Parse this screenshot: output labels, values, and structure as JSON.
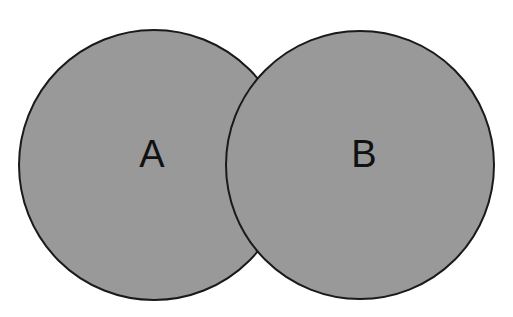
{
  "figure": {
    "type": "venn-diagram",
    "title": "",
    "background_color": "#ffffff",
    "width": 513,
    "height": 317
  },
  "chart_data": {
    "type": "venn",
    "title": "",
    "sets": [
      {
        "label": "A",
        "name": "set-a",
        "center_x": 154,
        "center_y": 165,
        "radius": 135,
        "fill": "#999999",
        "stroke": "#1a1a1a",
        "label_x": 152,
        "label_y": 154
      },
      {
        "label": "B",
        "name": "set-b",
        "center_x": 360,
        "center_y": 165,
        "radius": 134,
        "fill": "#999999",
        "stroke": "#1a1a1a",
        "label_x": 364,
        "label_y": 154
      }
    ],
    "intersection": {
      "label": "",
      "fill": "#999999",
      "shaded": true,
      "upper_crossing_x": 257,
      "upper_crossing_y": 68,
      "lower_crossing_x": 257,
      "lower_crossing_y": 262
    },
    "legend": [],
    "annotations": []
  },
  "style": {
    "fill_gray": "#999999",
    "stroke_dark": "#1a1a1a",
    "stroke_width": 2,
    "label_font_size": 38,
    "label_color": "#111111",
    "ghost_color": "#d9d9d9"
  },
  "labels": {
    "set_a": "A",
    "set_b": "B"
  },
  "scan_artifacts": {
    "line_1": "",
    "line_2": "",
    "line_3": "",
    "line_4": ""
  }
}
